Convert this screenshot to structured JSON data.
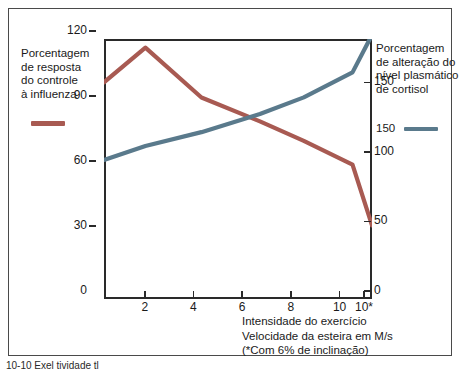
{
  "legend_left": {
    "lines": [
      "Porcentagem",
      "de resposta",
      "do controle",
      "à influenza"
    ],
    "color": "#a85a52"
  },
  "legend_right": {
    "lines": [
      "Porcentagem",
      "de alteração do",
      "nível plasmático",
      "de cortisol"
    ],
    "value_label": "150",
    "color": "#5a7a8c"
  },
  "axis_left": {
    "ticks": [
      "120",
      "90",
      "60",
      "30",
      "0"
    ]
  },
  "axis_right": {
    "ticks": [
      "150",
      "100",
      "50",
      "0"
    ]
  },
  "axis_bottom": {
    "ticks": [
      "2",
      "4",
      "6",
      "8",
      "10",
      "10*"
    ],
    "caption_lines": [
      "Intensidade do exercício",
      "Velocidade da esteira em M/s",
      "(*Com 6% de inclinação)"
    ]
  },
  "figure_caption": "10-10  Exel                      tividade                 tl",
  "chart_data": {
    "type": "line",
    "title": "",
    "xlabel": "Intensidade do exercício / Velocidade da esteira em M/s (*Com 6% de inclinação)",
    "ylabel": "Porcentagem de resposta do controle à influenza",
    "y2label": "Porcentagem de alteração do nível plasmático de cortisol",
    "x": [
      0,
      1.7,
      4.0,
      6.4,
      8.2,
      10.2,
      11.0
    ],
    "xlim": [
      0,
      11
    ],
    "ylim": [
      0,
      120
    ],
    "y2lim": [
      0,
      187
    ],
    "xtick_values": [
      2,
      4,
      6,
      8,
      10,
      11
    ],
    "xtick_labels": [
      "2",
      "4",
      "6",
      "8",
      "10",
      "10*"
    ],
    "ytick_values": [
      0,
      30,
      60,
      90,
      120
    ],
    "y2tick_values": [
      0,
      50,
      100,
      150
    ],
    "grid": false,
    "legend_position": "outside-left-and-right",
    "series": [
      {
        "name": "Porcentagem de resposta do controle à influenza",
        "axis": "left",
        "color": "#a85a52",
        "x": [
          0,
          1.7,
          4.0,
          6.4,
          8.2,
          10.2,
          11.0
        ],
        "values": [
          100,
          116,
          93,
          82,
          73,
          62,
          34
        ]
      },
      {
        "name": "Porcentagem de alteração do nível plasmático de cortisol",
        "axis": "right",
        "color": "#5a7a8c",
        "x": [
          0,
          1.7,
          4.0,
          6.4,
          8.2,
          10.2,
          11.0
        ],
        "values": [
          100,
          110,
          120,
          133,
          145,
          163,
          190
        ]
      }
    ]
  }
}
